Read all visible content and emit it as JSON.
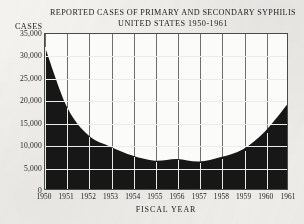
{
  "chart_data": {
    "type": "area",
    "title": "REPORTED CASES OF PRIMARY AND SECONDARY SYPHILIS",
    "subtitle": "UNITED STATES  1950-1961",
    "ylabel": "CASES",
    "xlabel": "FISCAL YEAR",
    "categories": [
      "1950",
      "1951",
      "1952",
      "1953",
      "1954",
      "1955",
      "1956",
      "1957",
      "1958",
      "1959",
      "1960",
      "1961"
    ],
    "values": [
      32000,
      18500,
      12000,
      9500,
      7500,
      6400,
      6800,
      6200,
      7200,
      9000,
      13000,
      19000
    ],
    "ylim": [
      0,
      35000
    ],
    "yticks": [
      35000,
      30000,
      25000,
      20000,
      15000,
      10000,
      5000,
      0
    ],
    "ytick_labels": [
      "35,000",
      "30,000",
      "25,000",
      "20,000",
      "15,000",
      "10,000",
      "5,000",
      "0"
    ],
    "grid": true,
    "legend": "none",
    "fill_color": "#171717",
    "plot_background": "#fbfbfa",
    "gridline_color": "#6e6e6e",
    "frame_color": "#4a4a4a",
    "page_background": "#f3f2ef"
  }
}
